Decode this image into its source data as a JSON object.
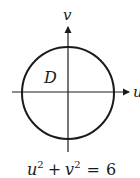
{
  "diagram": {
    "axes": {
      "horizontal_label": "u",
      "vertical_label": "v"
    },
    "region_label": "D",
    "equation": {
      "u_base": "u",
      "u_exp": "2",
      "plus": "+",
      "v_base": "v",
      "v_exp": "2",
      "equals": "=",
      "rhs": "6"
    },
    "colors": {
      "stroke": "#1a1a1a",
      "background": "#ffffff"
    }
  }
}
